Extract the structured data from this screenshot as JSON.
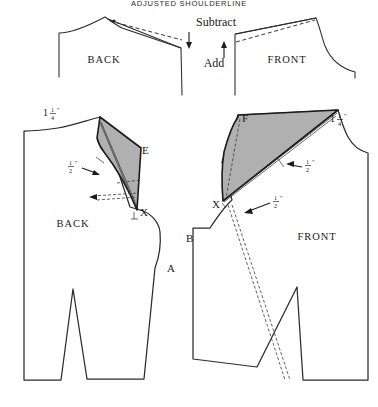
{
  "figure": {
    "title": "ADJUSTED SHOULDERLINE",
    "background_color": "#ffffff",
    "line_color": "#2b2b2b",
    "wedge_fill_color": "#b0b0b0"
  },
  "top_row": {
    "back_label": "BACK",
    "front_label": "FRONT",
    "subtract_label": "Subtract",
    "add_label": "Add",
    "subtract_arrow": "arrow-down-icon",
    "add_arrow": "arrow-up-icon"
  },
  "back_bodice": {
    "label": "BACK",
    "measurements": {
      "shoulder": {
        "whole": "1",
        "numerator": "1",
        "denominator": "4",
        "unit": "\""
      },
      "wedge": {
        "whole": "",
        "numerator": "1",
        "denominator": "2",
        "unit": "\""
      }
    },
    "points": {
      "e": "E",
      "x": "X",
      "a": "A"
    }
  },
  "front_bodice": {
    "label": "FRONT",
    "measurements": {
      "shoulder": {
        "whole": "1",
        "numerator": "1",
        "denominator": "4",
        "unit": "\""
      },
      "wedge": {
        "whole": "",
        "numerator": "1",
        "denominator": "2",
        "unit": "\""
      },
      "dart": {
        "whole": "",
        "numerator": "1",
        "denominator": "2",
        "unit": "\""
      }
    },
    "points": {
      "f": "F",
      "x": "X",
      "b": "B"
    }
  }
}
